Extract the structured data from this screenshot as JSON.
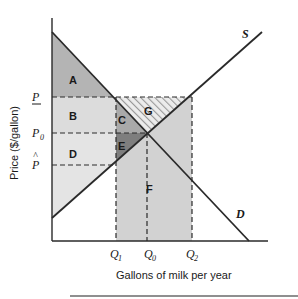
{
  "diagram": {
    "type": "supply-demand-price-floor",
    "axes": {
      "ylabel": "Price ($/gallon)",
      "xlabel": "Gallons of milk per year"
    },
    "curves": {
      "supply_label": "S",
      "demand_label": "D"
    },
    "price_levels": {
      "p_floor": "P",
      "p_zero": "P",
      "p_zero_sub": "0",
      "p_hat": "P",
      "p_hat_mark": "^"
    },
    "quantity_levels": {
      "q1": "Q",
      "q1_sub": "1",
      "q0": "Q",
      "q0_sub": "0",
      "q2": "Q",
      "q2_sub": "2"
    },
    "regions": {
      "A": "A",
      "B": "B",
      "C": "C",
      "D": "D",
      "E": "E",
      "F": "F",
      "G": "G"
    },
    "colors": {
      "region_A": "#b4b4b4",
      "region_B": "#dcdcdc",
      "region_C": "#a9a9a9",
      "region_D": "#e4e4e4",
      "region_E": "#7e7e7e",
      "region_F": "#d2d2d2",
      "hatch": "#9a9a9a",
      "line": "#2a2a2a"
    }
  }
}
